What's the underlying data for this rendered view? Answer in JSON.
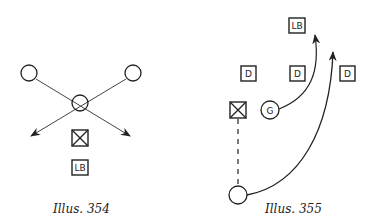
{
  "colors": {
    "ink": "#222222",
    "background": "#ffffff"
  },
  "illustrations": [
    {
      "caption": "Illus. 354",
      "labels": {
        "linebacker": "LB"
      }
    },
    {
      "caption": "Illus. 355",
      "labels": {
        "linebacker": "LB",
        "defender_1": "D",
        "defender_2": "D",
        "defender_3": "D",
        "guard": "G"
      }
    }
  ]
}
